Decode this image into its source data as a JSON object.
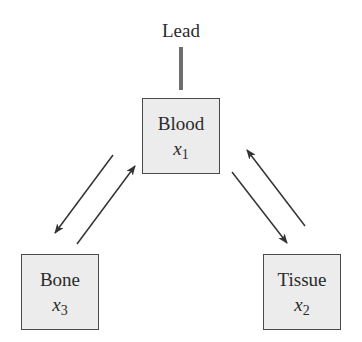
{
  "diagram": {
    "input": {
      "label": "Lead"
    },
    "compartments": [
      {
        "id": "blood",
        "name": "Blood",
        "variable": "x",
        "subscript": "1"
      },
      {
        "id": "tissue",
        "name": "Tissue",
        "variable": "x",
        "subscript": "2"
      },
      {
        "id": "bone",
        "name": "Bone",
        "variable": "x",
        "subscript": "3"
      }
    ],
    "flows": [
      {
        "from": "blood",
        "to": "bone"
      },
      {
        "from": "bone",
        "to": "blood"
      },
      {
        "from": "blood",
        "to": "tissue"
      },
      {
        "from": "tissue",
        "to": "blood"
      }
    ],
    "colors": {
      "box_fill": "#ececec",
      "box_border": "#4a4a4a",
      "arrow": "#333333",
      "lead_line": "#6e6e6e"
    }
  }
}
